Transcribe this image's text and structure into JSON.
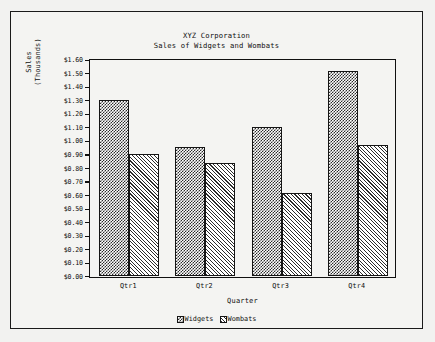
{
  "chart_data": {
    "type": "bar",
    "title": "XYZ Corporation",
    "subtitle": "Sales of Widgets and Wombats",
    "xlabel": "Quarter",
    "ylabel": "Sales",
    "ylabel_line2": "(Thousands)",
    "categories": [
      "Qtr1",
      "Qtr2",
      "Qtr3",
      "Qtr4"
    ],
    "series": [
      {
        "name": "Widgets",
        "values": [
          1.3,
          0.95,
          1.1,
          1.51
        ],
        "pattern": "checkerboard"
      },
      {
        "name": "Wombats",
        "values": [
          0.9,
          0.83,
          0.61,
          0.97
        ],
        "pattern": "diagonal-hatch"
      }
    ],
    "ylim": [
      0.0,
      1.6
    ],
    "ytick_step": 0.1,
    "ytick_labels": [
      "$1.60",
      "$1.50",
      "$1.40",
      "$1.30",
      "$1.20",
      "$1.10",
      "$1.00",
      "$0.90",
      "$0.80",
      "$0.70",
      "$0.60",
      "$0.50",
      "$0.40",
      "$0.30",
      "$0.20",
      "$0.10",
      "$0.00"
    ],
    "ytick_values": [
      1.6,
      1.5,
      1.4,
      1.3,
      1.2,
      1.1,
      1.0,
      0.9,
      0.8,
      0.7,
      0.6,
      0.5,
      0.4,
      0.3,
      0.2,
      0.1,
      0.0
    ],
    "grid": false,
    "legend_position": "bottom",
    "colors": {
      "foreground": "#101010",
      "plot_background": "#f4f4f2",
      "page_background": "#f2f2f0",
      "frame_border": "#1a1a1a"
    }
  }
}
